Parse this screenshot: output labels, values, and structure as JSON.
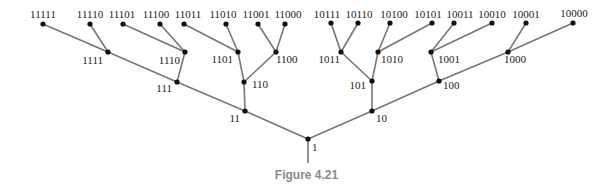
{
  "figure": {
    "caption": "Figure 4.21",
    "edge_color": "#777777",
    "node_color": "#111111"
  },
  "tree": {
    "root": "1",
    "nodes": [
      {
        "id": "1",
        "x": 308,
        "y": 139,
        "lx": 312,
        "ly": 151,
        "anchor": "start"
      },
      {
        "id": "11",
        "x": 245,
        "y": 111,
        "lx": 240,
        "ly": 122,
        "anchor": "end"
      },
      {
        "id": "10",
        "x": 372,
        "y": 111,
        "lx": 376,
        "ly": 122,
        "anchor": "start"
      },
      {
        "id": "111",
        "x": 177,
        "y": 82,
        "lx": 172,
        "ly": 92,
        "anchor": "end"
      },
      {
        "id": "110",
        "x": 244,
        "y": 82,
        "lx": 252,
        "ly": 88,
        "anchor": "start"
      },
      {
        "id": "101",
        "x": 372,
        "y": 81,
        "lx": 366,
        "ly": 89,
        "anchor": "end"
      },
      {
        "id": "100",
        "x": 439,
        "y": 81,
        "lx": 443,
        "ly": 89,
        "anchor": "start"
      },
      {
        "id": "1111",
        "x": 108,
        "y": 52,
        "lx": 103,
        "ly": 64,
        "anchor": "end"
      },
      {
        "id": "1110",
        "x": 185,
        "y": 52,
        "lx": 180,
        "ly": 64,
        "anchor": "end"
      },
      {
        "id": "1101",
        "x": 238,
        "y": 52,
        "lx": 233,
        "ly": 63,
        "anchor": "end"
      },
      {
        "id": "1100",
        "x": 276,
        "y": 52,
        "lx": 276,
        "ly": 63,
        "anchor": "start"
      },
      {
        "id": "1011",
        "x": 341,
        "y": 52,
        "lx": 340,
        "ly": 63,
        "anchor": "end"
      },
      {
        "id": "1010",
        "x": 378,
        "y": 52,
        "lx": 381,
        "ly": 63,
        "anchor": "start"
      },
      {
        "id": "1001",
        "x": 431,
        "y": 52,
        "lx": 438,
        "ly": 63,
        "anchor": "start"
      },
      {
        "id": "1000",
        "x": 508,
        "y": 52,
        "lx": 504,
        "ly": 63,
        "anchor": "start"
      },
      {
        "id": "11111",
        "x": 43,
        "y": 24,
        "lx": 43,
        "ly": 18,
        "anchor": "middle"
      },
      {
        "id": "11110",
        "x": 90,
        "y": 24,
        "lx": 90,
        "ly": 18,
        "anchor": "middle"
      },
      {
        "id": "11101",
        "x": 123,
        "y": 24,
        "lx": 122,
        "ly": 18,
        "anchor": "middle"
      },
      {
        "id": "11100",
        "x": 160,
        "y": 24,
        "lx": 156,
        "ly": 18,
        "anchor": "middle"
      },
      {
        "id": "11011",
        "x": 184,
        "y": 24,
        "lx": 188,
        "ly": 18,
        "anchor": "middle"
      },
      {
        "id": "11010",
        "x": 226,
        "y": 24,
        "lx": 223,
        "ly": 18,
        "anchor": "middle"
      },
      {
        "id": "11001",
        "x": 258,
        "y": 24,
        "lx": 256,
        "ly": 18,
        "anchor": "middle"
      },
      {
        "id": "11000",
        "x": 285,
        "y": 24,
        "lx": 288,
        "ly": 18,
        "anchor": "middle"
      },
      {
        "id": "10111",
        "x": 331,
        "y": 23,
        "lx": 327,
        "ly": 18,
        "anchor": "middle"
      },
      {
        "id": "10110",
        "x": 358,
        "y": 23,
        "lx": 359,
        "ly": 18,
        "anchor": "middle"
      },
      {
        "id": "10100",
        "x": 390,
        "y": 23,
        "lx": 394,
        "ly": 18,
        "anchor": "middle"
      },
      {
        "id": "10101",
        "x": 432,
        "y": 23,
        "lx": 428,
        "ly": 18,
        "anchor": "middle"
      },
      {
        "id": "10011",
        "x": 454,
        "y": 23,
        "lx": 460,
        "ly": 18,
        "anchor": "middle"
      },
      {
        "id": "10010",
        "x": 492,
        "y": 23,
        "lx": 492,
        "ly": 18,
        "anchor": "middle"
      },
      {
        "id": "10001",
        "x": 526,
        "y": 23,
        "lx": 526,
        "ly": 18,
        "anchor": "middle"
      },
      {
        "id": "10000",
        "x": 573,
        "y": 23,
        "lx": 574,
        "ly": 17,
        "anchor": "middle"
      }
    ],
    "edges": [
      [
        "1",
        "11"
      ],
      [
        "1",
        "10"
      ],
      [
        "11",
        "111"
      ],
      [
        "11",
        "110"
      ],
      [
        "10",
        "101"
      ],
      [
        "10",
        "100"
      ],
      [
        "111",
        "1111"
      ],
      [
        "111",
        "1110"
      ],
      [
        "110",
        "1101"
      ],
      [
        "110",
        "1100"
      ],
      [
        "101",
        "1011"
      ],
      [
        "101",
        "1010"
      ],
      [
        "100",
        "1001"
      ],
      [
        "100",
        "1000"
      ],
      [
        "1111",
        "11111"
      ],
      [
        "1111",
        "11110"
      ],
      [
        "1110",
        "11101"
      ],
      [
        "1110",
        "11100"
      ],
      [
        "1101",
        "11011"
      ],
      [
        "1101",
        "11010"
      ],
      [
        "1100",
        "11001"
      ],
      [
        "1100",
        "11000"
      ],
      [
        "1011",
        "10111"
      ],
      [
        "1011",
        "10110"
      ],
      [
        "1010",
        "10101"
      ],
      [
        "1010",
        "10100"
      ],
      [
        "1001",
        "10011"
      ],
      [
        "1001",
        "10010"
      ],
      [
        "1000",
        "10001"
      ],
      [
        "1000",
        "10000"
      ]
    ],
    "stem": {
      "x1": 308,
      "y1": 139,
      "x2": 308,
      "y2": 163
    }
  }
}
